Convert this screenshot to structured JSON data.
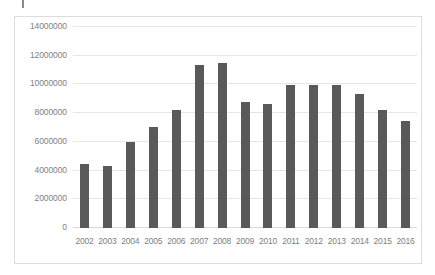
{
  "chart_data": {
    "type": "bar",
    "title": "",
    "subtitle": "",
    "xlabel": "",
    "ylabel": "",
    "categories": [
      "2002",
      "2003",
      "2004",
      "2005",
      "2006",
      "2007",
      "2008",
      "2009",
      "2010",
      "2011",
      "2012",
      "2013",
      "2014",
      "2015",
      "2016"
    ],
    "values": [
      4450000,
      4350000,
      6000000,
      7050000,
      8250000,
      11350000,
      11500000,
      8800000,
      8650000,
      9950000,
      9950000,
      9950000,
      9350000,
      8250000,
      7450000
    ],
    "series": [
      {
        "name": "",
        "values": [
          4450000,
          4350000,
          6000000,
          7050000,
          8250000,
          11350000,
          11500000,
          8800000,
          8650000,
          9950000,
          9950000,
          9950000,
          9350000,
          8250000,
          7450000
        ]
      }
    ],
    "ylim": [
      0,
      14000000
    ],
    "ytick_values": [
      0,
      2000000,
      4000000,
      6000000,
      8000000,
      10000000,
      12000000,
      14000000
    ],
    "ytick_labels": [
      "0",
      "2000000",
      "4000000",
      "6000000",
      "8000000",
      "10000000",
      "12000000",
      "14000000"
    ],
    "grid": true,
    "grid_axis": "y",
    "legend": false,
    "legend_position": "none",
    "annotations": [],
    "colors": {
      "bar": "#595959",
      "gridline": "#e6e6e6",
      "baseline": "#d9d9d9",
      "frame_border": "#dcdcdc",
      "tick_label": "#7f7f7f",
      "background": "#ffffff"
    }
  }
}
